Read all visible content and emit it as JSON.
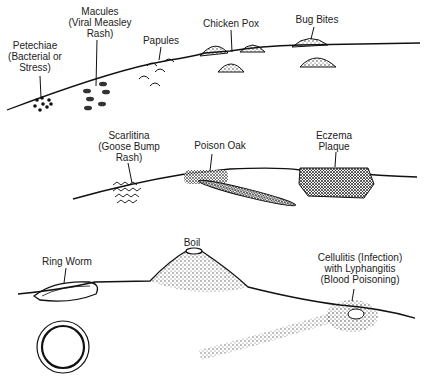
{
  "panels": [
    {
      "id": "top",
      "labels": [
        {
          "name": "petechiae",
          "lines": [
            "Petechiae",
            "(Bacterial or",
            "Stress)"
          ],
          "x": 35,
          "y": 40
        },
        {
          "name": "macules",
          "lines": [
            "Macules",
            "(Viral Measley",
            "Rash)"
          ],
          "x": 102,
          "y": 5
        },
        {
          "name": "papules",
          "lines": [
            "Papules"
          ],
          "x": 161,
          "y": 35
        },
        {
          "name": "chicken-pox",
          "lines": [
            "Chicken Pox"
          ],
          "x": 233,
          "y": 18
        },
        {
          "name": "bug-bites",
          "lines": [
            "Bug Bites"
          ],
          "x": 317,
          "y": 14
        }
      ]
    },
    {
      "id": "middle",
      "labels": [
        {
          "name": "scarlitina",
          "lines": [
            "Scarlitina",
            "(Goose Bump",
            "Rash)"
          ],
          "x": 129,
          "y": 131
        },
        {
          "name": "poison-oak",
          "lines": [
            "Poison Oak"
          ],
          "x": 221,
          "y": 141
        },
        {
          "name": "eczema",
          "lines": [
            "Eczema",
            "Plaque"
          ],
          "x": 332,
          "y": 131
        }
      ]
    },
    {
      "id": "bottom",
      "labels": [
        {
          "name": "ring-worm",
          "lines": [
            "Ring Worm"
          ],
          "x": 67,
          "y": 256
        },
        {
          "name": "boil",
          "lines": [
            "Boil"
          ],
          "x": 192,
          "y": 238
        },
        {
          "name": "cellulitis",
          "lines": [
            "Cellulitis (Infection)",
            "with Lyphangitis",
            "(Blood Poisoning)"
          ],
          "x": 370,
          "y": 255
        }
      ]
    }
  ]
}
